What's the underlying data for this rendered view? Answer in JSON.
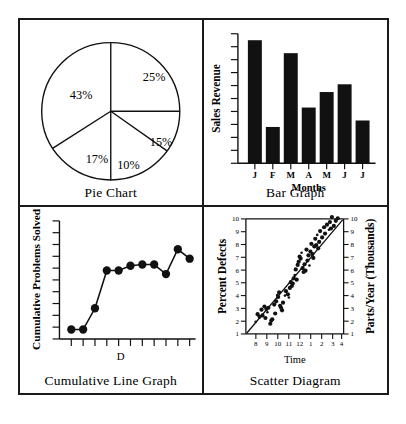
{
  "figure": {
    "panels": [
      {
        "id": "pie",
        "caption": "Pie Chart"
      },
      {
        "id": "bar",
        "caption": "Bar Graph"
      },
      {
        "id": "line",
        "caption": "Cumulative Line Graph"
      },
      {
        "id": "scatter",
        "caption": "Scatter Diagram"
      }
    ]
  },
  "chart_data": [
    {
      "type": "pie",
      "title": "Pie Chart",
      "labels": [
        "25%",
        "15%",
        "10%",
        "17%",
        "43%"
      ],
      "values": [
        25,
        15,
        10,
        17,
        43
      ],
      "slice_labels": [
        {
          "text": "25%",
          "cx": 136,
          "cy": 62
        },
        {
          "text": "15%",
          "cx": 141,
          "cy": 126
        },
        {
          "text": "10%",
          "cx": 111,
          "cy": 148
        },
        {
          "text": "17%",
          "cx": 80,
          "cy": 143
        },
        {
          "text": "43%",
          "cx": 64,
          "cy": 78
        }
      ],
      "legend": "none",
      "grid": false
    },
    {
      "type": "bar",
      "title": "Bar Graph",
      "xlabel": "Months",
      "ylabel": "Sales Revenue",
      "categories": [
        "J",
        "F",
        "M",
        "A",
        "M",
        "J",
        "J"
      ],
      "values": [
        95,
        28,
        85,
        43,
        55,
        61,
        33
      ],
      "ylim": [
        0,
        100
      ],
      "ytick_count": 10,
      "ytick_labels": [],
      "grid": false,
      "bar_color": "#111111"
    },
    {
      "type": "line",
      "title": "Cumulative Line Graph",
      "xlabel": "D",
      "ylabel": "Cumulative Problems Solved",
      "x": [
        1,
        2,
        3,
        4,
        5,
        6,
        7,
        8,
        9,
        10,
        11
      ],
      "values": [
        8,
        8,
        26,
        58,
        58,
        62,
        63,
        63,
        55,
        76,
        68
      ],
      "ylim": [
        0,
        100
      ],
      "ytick_count": 10,
      "xtick_count": 11,
      "marker": "filled-circle",
      "grid": false
    },
    {
      "type": "scatter",
      "title": "Scatter Diagram",
      "xlabel": "Time",
      "ylabel": "Percent Defects",
      "y2label": "Parts/Year (Thousands)",
      "xtick_labels": [
        "8",
        "9",
        "10",
        "11",
        "12",
        "1",
        "2",
        "3",
        "4"
      ],
      "ytick_labels": [
        "1",
        "2",
        "3",
        "4",
        "5",
        "6",
        "7",
        "8",
        "9",
        "10"
      ],
      "y2tick_labels": [
        "1",
        "2",
        "3",
        "4",
        "5",
        "6",
        "7",
        "8",
        "9",
        "10"
      ],
      "ylim": [
        1,
        10
      ],
      "y2lim": [
        1,
        10
      ],
      "trend": "positive-linear",
      "grid": false,
      "points": [
        [
          0.1,
          1.95
        ],
        [
          0.12,
          2.55
        ],
        [
          0.14,
          2.35
        ],
        [
          0.16,
          2.9
        ],
        [
          0.17,
          2.45
        ],
        [
          0.19,
          3.15
        ],
        [
          0.2,
          2.25
        ],
        [
          0.22,
          2.7
        ],
        [
          0.23,
          3.05
        ],
        [
          0.25,
          1.8
        ],
        [
          0.26,
          2.05
        ],
        [
          0.27,
          2.15
        ],
        [
          0.29,
          3.3
        ],
        [
          0.31,
          3.55
        ],
        [
          0.32,
          4.05
        ],
        [
          0.33,
          3.9
        ],
        [
          0.34,
          4.25
        ],
        [
          0.35,
          3.2
        ],
        [
          0.36,
          3.05
        ],
        [
          0.37,
          2.85
        ],
        [
          0.38,
          3.45
        ],
        [
          0.4,
          4.0
        ],
        [
          0.41,
          4.35
        ],
        [
          0.43,
          4.1
        ],
        [
          0.45,
          4.6
        ],
        [
          0.46,
          5.05
        ],
        [
          0.47,
          4.75
        ],
        [
          0.49,
          5.35
        ],
        [
          0.5,
          5.6
        ],
        [
          0.51,
          6.05
        ],
        [
          0.52,
          5.25
        ],
        [
          0.53,
          6.4
        ],
        [
          0.54,
          6.65
        ],
        [
          0.55,
          7.05
        ],
        [
          0.56,
          6.9
        ],
        [
          0.57,
          7.35
        ],
        [
          0.58,
          6.15
        ],
        [
          0.59,
          5.85
        ],
        [
          0.6,
          6.45
        ],
        [
          0.62,
          7.6
        ],
        [
          0.63,
          6.75
        ],
        [
          0.64,
          7.15
        ],
        [
          0.65,
          6.35
        ],
        [
          0.66,
          7.45
        ],
        [
          0.67,
          8.05
        ],
        [
          0.68,
          7.25
        ],
        [
          0.7,
          7.85
        ],
        [
          0.71,
          8.45
        ],
        [
          0.72,
          7.95
        ],
        [
          0.73,
          8.75
        ],
        [
          0.75,
          8.2
        ],
        [
          0.76,
          9.05
        ],
        [
          0.78,
          8.55
        ],
        [
          0.8,
          9.35
        ],
        [
          0.81,
          8.85
        ],
        [
          0.83,
          9.55
        ],
        [
          0.85,
          9.15
        ],
        [
          0.86,
          9.75
        ],
        [
          0.88,
          10.15
        ],
        [
          0.9,
          9.45
        ],
        [
          0.92,
          9.85
        ],
        [
          0.94,
          10.05
        ],
        [
          0.3,
          2.6
        ],
        [
          0.44,
          3.85
        ],
        [
          0.61,
          5.95
        ],
        [
          0.74,
          7.7
        ],
        [
          0.21,
          2.95
        ],
        [
          0.48,
          4.95
        ],
        [
          0.69,
          6.95
        ],
        [
          0.87,
          9.25
        ]
      ]
    }
  ]
}
